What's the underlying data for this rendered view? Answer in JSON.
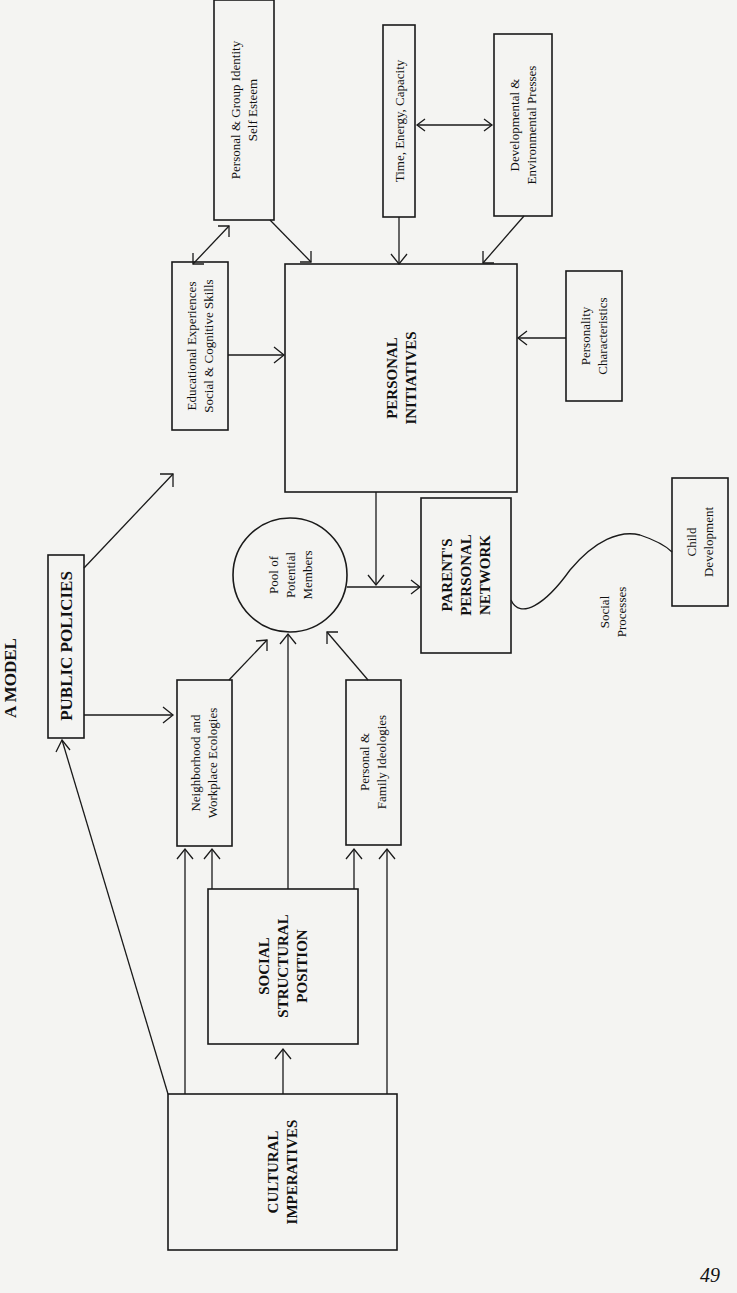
{
  "title": "A MODEL",
  "page_number": "49",
  "nodes": {
    "public_policies": [
      "PUBLIC POLICIES"
    ],
    "educational": [
      "Educational Experiences",
      "Social & Cognitive Skills"
    ],
    "identity": [
      "Personal & Group Identity",
      "Self Esteem"
    ],
    "time": [
      "Time, Energy, Capacity"
    ],
    "presses": [
      "Developmental &",
      "Environmental Presses"
    ],
    "personal_initiatives": [
      "PERSONAL",
      "INITIATIVES"
    ],
    "personality": [
      "Personality",
      "Characteristics"
    ],
    "neighborhood": [
      "Neighborhood and",
      "Workplace Ecologies"
    ],
    "pool": [
      "Pool of",
      "Potential",
      "Members"
    ],
    "ideologies": [
      "Personal &",
      "Family Ideologies"
    ],
    "network": [
      "PARENT'S",
      "PERSONAL",
      "NETWORK"
    ],
    "social_processes": [
      "Social",
      "Processes"
    ],
    "child": [
      "Child",
      "Development"
    ],
    "social_structural": [
      "SOCIAL",
      "STRUCTURAL",
      "POSITION"
    ],
    "cultural": [
      "CULTURAL",
      "IMPERATIVES"
    ]
  }
}
